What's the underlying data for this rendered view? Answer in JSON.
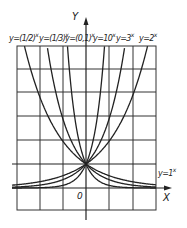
{
  "figure": {
    "y_axis_label": "Y",
    "x_axis_label": "X",
    "origin_label": "0",
    "curves": [
      {
        "base": "(1/2)",
        "label": "y=(1/2)",
        "exp": "x",
        "b": 0.5
      },
      {
        "base": "(1/3)",
        "label": "y=(1/3)",
        "exp": "x",
        "b": 0.3333
      },
      {
        "base": "(0,1)",
        "label": "y=(0,1)",
        "exp": "x",
        "b": 0.1
      },
      {
        "base": "10",
        "label": "y=10",
        "exp": "x",
        "b": 10
      },
      {
        "base": "3",
        "label": "y=3",
        "exp": "x",
        "b": 3
      },
      {
        "base": "2",
        "label": "y=2",
        "exp": "x",
        "b": 2
      }
    ],
    "constant_curve": {
      "label": "y=1",
      "exp": "x"
    },
    "colors": {
      "line": "#222222",
      "grid": "#333333",
      "background": "#ffffff"
    }
  }
}
